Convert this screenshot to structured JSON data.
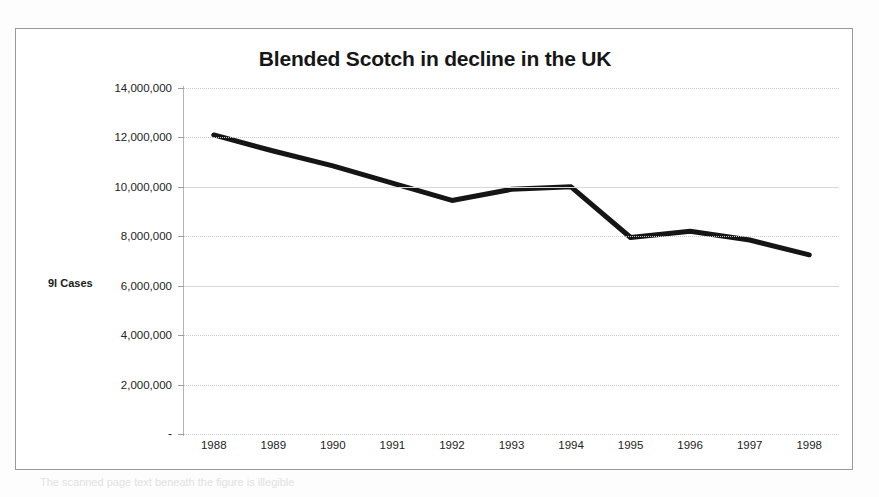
{
  "document": {
    "type": "scanned-chart-figure",
    "background_color": "#fdfdfd",
    "frame_border_color": "#9a9a9a",
    "scan_artifact_text": "The scanned page text beneath the figure is illegible"
  },
  "chart_data": {
    "type": "line",
    "title": "Blended Scotch in decline in the UK",
    "xlabel": "",
    "ylabel": "9l Cases",
    "categories": [
      "1988",
      "1989",
      "1990",
      "1991",
      "1992",
      "1993",
      "1994",
      "1995",
      "1996",
      "1997",
      "1998"
    ],
    "values": [
      12100000,
      11450000,
      10850000,
      10150000,
      9450000,
      9900000,
      10000000,
      7950000,
      8200000,
      7850000,
      7250000
    ],
    "ylim": [
      0,
      14000000
    ],
    "ytick_values": [
      0,
      2000000,
      4000000,
      6000000,
      8000000,
      10000000,
      12000000,
      14000000
    ],
    "ytick_labels": [
      "-",
      "2,000,000",
      "4,000,000",
      "6,000,000",
      "8,000,000",
      "10,000,000",
      "12,000,000",
      "14,000,000"
    ],
    "grid": true,
    "grid_style": "dotted",
    "grid_color": "#c9c9c9",
    "legend": false,
    "legend_position": "none",
    "series_color": "#151515",
    "series_line_width": 5,
    "markers": false
  }
}
